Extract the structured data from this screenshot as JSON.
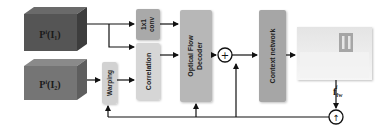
{
  "diagram": {
    "inputs": [
      {
        "id": "p1",
        "label_main": "P",
        "label_sup": "i",
        "label_arg": "I",
        "label_sub": "1",
        "color": "#4f4f4f"
      },
      {
        "id": "p2",
        "label_main": "P",
        "label_sup": "i",
        "label_arg": "I",
        "label_sub": "2",
        "color": "#6e6e6e"
      }
    ],
    "modules": {
      "conv": {
        "line1": "1x1",
        "line2": "conv",
        "color": "#a9a9a9"
      },
      "warping": {
        "label": "Warping",
        "color": "#d2d2d2"
      },
      "correlation": {
        "label": "Correlation",
        "color": "#d6d6d6"
      },
      "decoder": {
        "line1": "Optical Flow",
        "line2": "Decoder",
        "color": "#b7b7b7"
      },
      "context": {
        "label": "Context network",
        "color": "#a6a6a6"
      }
    },
    "operators": {
      "add": {
        "symbol": "+"
      },
      "upsample": {
        "symbol": "↑"
      }
    },
    "output": {
      "label_main": "f",
      "label_sub": "fw",
      "label_sup": "i"
    },
    "colors": {
      "line": "#111111",
      "background": "#ffffff"
    }
  }
}
